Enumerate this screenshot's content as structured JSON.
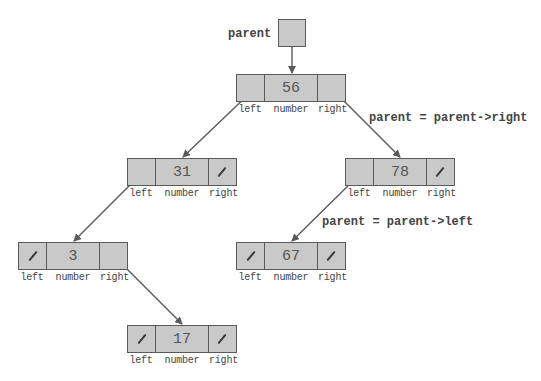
{
  "diagram": {
    "parent_label": "parent",
    "field_labels": {
      "left": "left",
      "number": "number",
      "right": "right"
    },
    "captions": {
      "step1": "parent = parent->right",
      "step2": "parent = parent->left"
    },
    "nodes": [
      {
        "id": "n56",
        "value": "56",
        "left": "pointer",
        "right": "pointer"
      },
      {
        "id": "n31",
        "value": "31",
        "left": "pointer",
        "right": "null"
      },
      {
        "id": "n78",
        "value": "78",
        "left": "pointer",
        "right": "null"
      },
      {
        "id": "n3",
        "value": "3",
        "left": "null",
        "right": "pointer"
      },
      {
        "id": "n67",
        "value": "67",
        "left": "null",
        "right": "null"
      },
      {
        "id": "n17",
        "value": "17",
        "left": "null",
        "right": "null"
      }
    ],
    "edges": [
      {
        "from": "parent",
        "to": "n56"
      },
      {
        "from": "n56.left",
        "to": "n31"
      },
      {
        "from": "n56.right",
        "to": "n78"
      },
      {
        "from": "n31.left",
        "to": "n3"
      },
      {
        "from": "n78.left",
        "to": "n67"
      },
      {
        "from": "n3.right",
        "to": "n17"
      }
    ],
    "colors": {
      "fill": "#c9c9c9",
      "ink": "#5a5a5a"
    }
  }
}
